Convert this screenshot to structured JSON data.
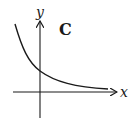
{
  "diagram": {
    "panel_label": "C",
    "axes": {
      "x_label": "x",
      "y_label": "y"
    },
    "curve": {
      "description": "decreasing exponential decay curve, y-intercept positive, asymptotic to x-axis",
      "color": "#1a1a1a"
    },
    "colors": {
      "ink": "#1a1a1a",
      "background": "#ffffff"
    }
  }
}
